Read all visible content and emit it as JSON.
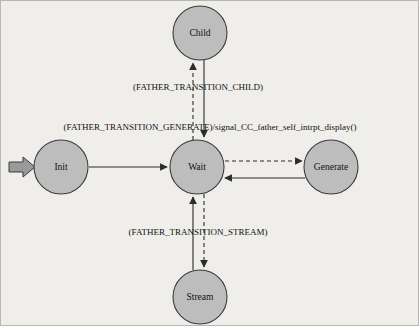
{
  "diagram": {
    "background_color": "#efeeea",
    "node_fill_color": "#bdbdbd",
    "node_stroke_color": "#3a3a3a",
    "edge_color": "#2b2b2b",
    "start_marker_color": "#9a9a9a",
    "states": [
      {
        "id": "child",
        "label": "Child",
        "cx": 199,
        "cy": 32,
        "r": 27
      },
      {
        "id": "init",
        "label": "Init",
        "cx": 60,
        "cy": 166,
        "r": 27
      },
      {
        "id": "wait",
        "label": "Wait",
        "cx": 196,
        "cy": 166,
        "r": 27
      },
      {
        "id": "generate",
        "label": "Generate",
        "cx": 330,
        "cy": 166,
        "r": 27
      },
      {
        "id": "stream",
        "label": "Stream",
        "cx": 199,
        "cy": 296,
        "r": 27
      }
    ],
    "transitions": [
      {
        "id": "start-to-init",
        "from": "start",
        "to": "init",
        "style": "block-arrow",
        "label": ""
      },
      {
        "id": "init-to-wait",
        "from": "init",
        "to": "wait",
        "style": "solid",
        "label": ""
      },
      {
        "id": "wait-to-child",
        "from": "wait",
        "to": "child",
        "style": "dashed",
        "label": "(FATHER_TRANSITION_CHILD)"
      },
      {
        "id": "child-to-wait",
        "from": "child",
        "to": "wait",
        "style": "solid",
        "label": ""
      },
      {
        "id": "wait-to-generate",
        "from": "wait",
        "to": "generate",
        "style": "dashed",
        "label": "(FATHER_TRANSITION_GENERATE)/signal_CC_father_self_intrpt_display()"
      },
      {
        "id": "generate-to-wait",
        "from": "generate",
        "to": "wait",
        "style": "solid",
        "label": ""
      },
      {
        "id": "wait-to-stream",
        "from": "wait",
        "to": "stream",
        "style": "dashed",
        "label": "(FATHER_TRANSITION_STREAM)"
      },
      {
        "id": "stream-to-wait",
        "from": "stream",
        "to": "wait",
        "style": "solid",
        "label": ""
      }
    ],
    "labels": {
      "child_transition": "(FATHER_TRANSITION_CHILD)",
      "generate_transition": "(FATHER_TRANSITION_GENERATE)/signal_CC_father_self_intrpt_display()",
      "stream_transition": "(FATHER_TRANSITION_STREAM)"
    }
  }
}
